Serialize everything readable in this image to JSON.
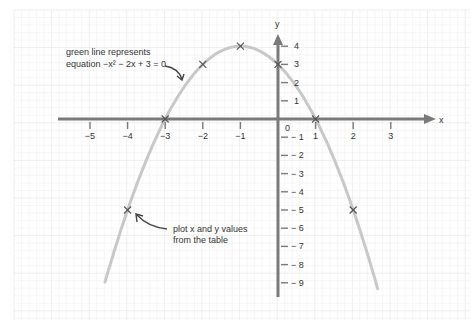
{
  "chart_data": {
    "type": "line",
    "title": "",
    "equation": "−x² − 2x + 3 = 0",
    "xlabel": "x",
    "ylabel": "y",
    "xlim": [
      -5.8,
      4.2
    ],
    "ylim": [
      -9.8,
      4.5
    ],
    "grid": true,
    "x_ticks": [
      -5,
      -4,
      -3,
      -2,
      -1,
      1,
      2,
      3
    ],
    "y_ticks": [
      4,
      3,
      2,
      1,
      -1,
      -2,
      -3,
      -4,
      -5,
      -6,
      -7,
      -8,
      -9
    ],
    "origin_label": "0",
    "series": [
      {
        "name": "green line",
        "curve": "y = -x^2 - 2x + 3",
        "x_range": [
          -4.6,
          2.65
        ],
        "color": "#c8c8c8"
      }
    ],
    "points": [
      {
        "x": -4,
        "y": -5
      },
      {
        "x": -3,
        "y": 0
      },
      {
        "x": -2,
        "y": 3
      },
      {
        "x": -1,
        "y": 4
      },
      {
        "x": 0,
        "y": 3
      },
      {
        "x": 1,
        "y": 0
      },
      {
        "x": 2,
        "y": -5
      }
    ],
    "annotations": [
      {
        "lines": [
          "green line represents",
          "equation −x² − 2x + 3 = 0"
        ]
      },
      {
        "lines": [
          "plot x and y values",
          "from the table"
        ]
      }
    ]
  },
  "colors": {
    "axis": "#7a7a7a",
    "curve": "#c8c8c8",
    "grid_minor": "#f0f0f0",
    "grid_major": "#e2e2e2",
    "marker": "#555555",
    "text": "#333333"
  }
}
